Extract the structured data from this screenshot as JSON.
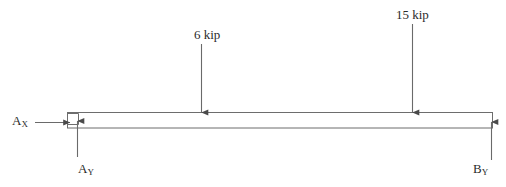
{
  "figure": {
    "type": "free-body-diagram",
    "beam": {
      "x_left": 67,
      "x_right": 493,
      "y_top": 112,
      "y_bottom": 128,
      "stroke": "#5a5a5a",
      "fill": "#ffffff"
    },
    "loads": [
      {
        "id": "load-1",
        "label": "6 kip",
        "magnitude": 6,
        "unit": "kip",
        "direction": "down",
        "x": 201,
        "y_tail": 44,
        "y_head": 113
      },
      {
        "id": "load-2",
        "label": "15 kip",
        "magnitude": 15,
        "unit": "kip",
        "direction": "down",
        "x": 412,
        "y_tail": 24,
        "y_head": 113
      }
    ],
    "reactions": [
      {
        "id": "ax",
        "label_base": "A",
        "label_sub": "X",
        "direction": "right",
        "x_tail": 35,
        "x_head": 70,
        "y": 122
      },
      {
        "id": "ay",
        "label_base": "A",
        "label_sub": "Y",
        "direction": "up",
        "x": 77,
        "y_tail": 157,
        "y_head": 121
      },
      {
        "id": "by",
        "label_base": "B",
        "label_sub": "Y",
        "direction": "up",
        "x": 491,
        "y_tail": 160,
        "y_head": 122
      }
    ],
    "support_marker": {
      "id": "right-angle-square",
      "x": 67,
      "y": 113,
      "size": 11,
      "stroke": "#5a5a5a"
    },
    "top_ghost_text": ""
  }
}
